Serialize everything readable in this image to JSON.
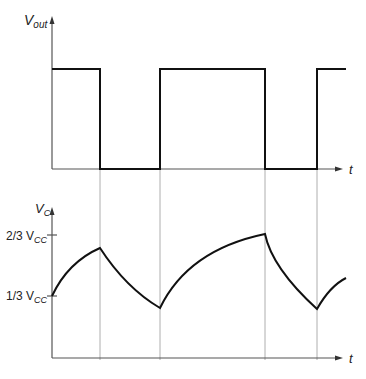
{
  "diagram": {
    "top_plot": {
      "y_label_main": "V",
      "y_label_sub": "out",
      "x_label": "t",
      "transitions_x": [
        100,
        160,
        265,
        317
      ]
    },
    "bottom_plot": {
      "y_label_main": "V",
      "y_label_sub": "C",
      "x_label": "t",
      "tick_upper": {
        "prefix": "2/3 V",
        "sub": "CC"
      },
      "tick_lower": {
        "prefix": "1/3 V",
        "sub": "CC"
      }
    }
  }
}
